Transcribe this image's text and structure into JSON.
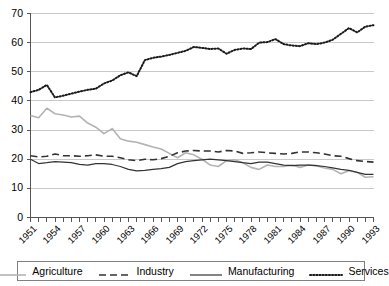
{
  "chart_data": {
    "type": "line",
    "title": "",
    "xlabel": "",
    "ylabel": "",
    "xlim": [
      1951,
      1993
    ],
    "ylim": [
      0,
      70
    ],
    "ytick_step": 10,
    "yticks": [
      0,
      10,
      20,
      30,
      40,
      50,
      60,
      70
    ],
    "grid": true,
    "legend_position": "bottom",
    "x": [
      1951,
      1952,
      1953,
      1954,
      1955,
      1956,
      1957,
      1958,
      1959,
      1960,
      1961,
      1962,
      1963,
      1964,
      1965,
      1966,
      1967,
      1968,
      1969,
      1970,
      1971,
      1972,
      1973,
      1974,
      1975,
      1976,
      1977,
      1978,
      1979,
      1980,
      1981,
      1982,
      1983,
      1984,
      1985,
      1986,
      1987,
      1988,
      1989,
      1990,
      1991,
      1992,
      1993
    ],
    "xtick_labels": [
      "1951",
      "1954",
      "1957",
      "1960",
      "1963",
      "1966",
      "1969",
      "1972",
      "1975",
      "1978",
      "1981",
      "1984",
      "1987",
      "1990",
      "1993"
    ],
    "series": [
      {
        "name": "Agriculture",
        "style": "solid",
        "color": "#b3b3b3",
        "width": 1.6,
        "values": [
          35.0,
          34.2,
          37.5,
          35.6,
          35.2,
          34.5,
          34.8,
          32.4,
          31.0,
          28.8,
          30.5,
          27.0,
          26.2,
          25.8,
          25.0,
          24.2,
          23.5,
          22.0,
          20.5,
          22.2,
          21.5,
          20.0,
          18.0,
          17.5,
          19.5,
          19.8,
          18.8,
          17.2,
          16.5,
          18.0,
          17.5,
          17.5,
          18.0,
          17.2,
          18.0,
          17.8,
          17.0,
          16.5,
          15.0,
          16.0,
          15.5,
          13.8,
          14.0
        ]
      },
      {
        "name": "Industry",
        "style": "dashed",
        "color": "#333333",
        "width": 1.6,
        "values": [
          21.2,
          20.8,
          21.0,
          21.8,
          21.2,
          21.2,
          21.0,
          21.2,
          21.5,
          21.0,
          21.0,
          20.5,
          19.8,
          19.5,
          20.0,
          19.8,
          20.2,
          21.0,
          22.2,
          22.8,
          23.0,
          22.8,
          22.8,
          22.5,
          23.0,
          22.8,
          22.0,
          22.2,
          22.5,
          22.2,
          22.0,
          21.8,
          22.0,
          22.5,
          22.5,
          22.2,
          21.8,
          21.2,
          21.0,
          20.2,
          19.5,
          19.2,
          19.0
        ]
      },
      {
        "name": "Manufacturing",
        "style": "solid",
        "color": "#333333",
        "width": 1.2,
        "values": [
          20.0,
          18.5,
          18.8,
          19.2,
          19.0,
          18.8,
          18.2,
          18.0,
          18.5,
          18.5,
          18.2,
          17.5,
          16.5,
          16.0,
          16.2,
          16.5,
          16.8,
          17.2,
          18.5,
          19.2,
          19.5,
          19.8,
          20.0,
          19.8,
          19.5,
          19.2,
          18.8,
          18.5,
          19.0,
          19.0,
          18.5,
          18.0,
          17.8,
          18.0,
          18.0,
          17.8,
          17.5,
          17.0,
          16.5,
          16.2,
          15.5,
          14.8,
          14.8
        ]
      },
      {
        "name": "Services",
        "style": "dotted",
        "color": "#1a1a1a",
        "width": 2.0,
        "values": [
          43.0,
          43.8,
          45.5,
          41.2,
          41.8,
          42.5,
          43.2,
          43.8,
          44.2,
          46.0,
          47.0,
          48.8,
          49.8,
          48.5,
          54.0,
          54.8,
          55.2,
          55.8,
          56.5,
          57.2,
          58.5,
          58.2,
          57.8,
          58.0,
          56.2,
          57.5,
          58.0,
          57.8,
          60.0,
          60.2,
          61.2,
          59.5,
          59.0,
          58.8,
          59.8,
          59.5,
          60.0,
          61.0,
          63.0,
          65.0,
          63.5,
          65.5,
          66.0
        ]
      }
    ]
  },
  "legend": {
    "items": [
      {
        "label": "Agriculture"
      },
      {
        "label": "Industry"
      },
      {
        "label": "Manufacturing"
      },
      {
        "label": "Services"
      }
    ]
  }
}
